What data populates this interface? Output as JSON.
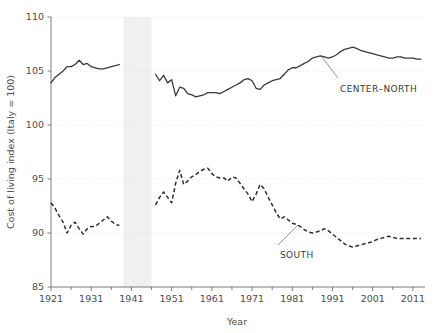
{
  "chart_data": {
    "type": "line",
    "title": "",
    "xlabel": "Year",
    "ylabel": "Cost of living index (Italy = 100)",
    "xlim": [
      1921,
      2014
    ],
    "ylim": [
      85,
      110
    ],
    "yticks": [
      85,
      90,
      95,
      100,
      105,
      110
    ],
    "xticks": [
      1921,
      1931,
      1941,
      1951,
      1961,
      1971,
      1981,
      1991,
      2001,
      2011
    ],
    "xminorticks": [
      1926,
      1936,
      1946,
      1956,
      1966,
      1976,
      1986,
      1996,
      2006
    ],
    "grid": "horizontal-dotted",
    "legend_position": "inline-annotation",
    "annotations": [
      {
        "text": "CENTER–NORTH",
        "series": "center_north",
        "x": 1995,
        "y": 104.3
      },
      {
        "text": "SOUTH",
        "series": "south",
        "x": 1988,
        "y": 87.6
      }
    ],
    "shaded_region": {
      "label": "war-gap",
      "x0": 1939,
      "x1": 1946,
      "color": "#f0f0f0"
    },
    "series": [
      {
        "name": "CENTER–NORTH",
        "style": "solid",
        "color": "#3a3a3a",
        "segments": [
          {
            "x": [
              1921,
              1922,
              1923,
              1924,
              1925,
              1926,
              1927,
              1928,
              1929,
              1930,
              1931,
              1932,
              1933,
              1934,
              1935,
              1936,
              1937,
              1938
            ],
            "values": [
              103.9,
              104.4,
              104.7,
              105.0,
              105.4,
              105.4,
              105.6,
              106.0,
              105.6,
              105.7,
              105.4,
              105.3,
              105.2,
              105.2,
              105.3,
              105.4,
              105.5,
              105.6
            ]
          },
          {
            "x": [
              1947,
              1948,
              1949,
              1950,
              1951,
              1952,
              1953,
              1954,
              1955,
              1956,
              1957,
              1958,
              1959,
              1960,
              1961,
              1962,
              1963,
              1964,
              1965,
              1966,
              1967,
              1968,
              1969,
              1970,
              1971,
              1972,
              1973,
              1974,
              1975,
              1976,
              1977,
              1978,
              1979,
              1980,
              1981,
              1982,
              1983,
              1984,
              1985,
              1986,
              1987,
              1988,
              1989,
              1990,
              1991,
              1992,
              1993,
              1994,
              1995,
              1996,
              1997,
              1998,
              1999,
              2000,
              2001,
              2002,
              2003,
              2004,
              2005,
              2006,
              2007,
              2008,
              2009,
              2010,
              2011,
              2012,
              2013
            ],
            "values": [
              104.7,
              104.1,
              104.6,
              103.9,
              104.2,
              102.7,
              103.5,
              103.4,
              102.9,
              102.8,
              102.6,
              102.7,
              102.8,
              103.0,
              103.0,
              103.0,
              102.9,
              103.1,
              103.3,
              103.5,
              103.7,
              103.9,
              104.2,
              104.3,
              104.1,
              103.4,
              103.3,
              103.7,
              103.9,
              104.1,
              104.2,
              104.3,
              104.7,
              105.1,
              105.3,
              105.3,
              105.5,
              105.7,
              105.9,
              106.2,
              106.3,
              106.4,
              106.3,
              106.2,
              106.3,
              106.5,
              106.8,
              107.0,
              107.1,
              107.2,
              107.1,
              106.9,
              106.8,
              106.7,
              106.6,
              106.5,
              106.4,
              106.3,
              106.2,
              106.2,
              106.3,
              106.3,
              106.2,
              106.2,
              106.2,
              106.1,
              106.1
            ]
          }
        ]
      },
      {
        "name": "SOUTH",
        "style": "dashed",
        "color": "#2e2e2e",
        "segments": [
          {
            "x": [
              1921,
              1922,
              1923,
              1924,
              1925,
              1926,
              1927,
              1928,
              1929,
              1930,
              1931,
              1932,
              1933,
              1934,
              1935,
              1936,
              1937,
              1938
            ],
            "values": [
              92.8,
              92.3,
              91.6,
              91.0,
              90.0,
              90.7,
              91.0,
              90.4,
              89.9,
              90.4,
              90.6,
              90.6,
              90.9,
              91.2,
              91.5,
              91.1,
              90.8,
              90.7
            ]
          },
          {
            "x": [
              1947,
              1948,
              1949,
              1950,
              1951,
              1952,
              1953,
              1954,
              1955,
              1956,
              1957,
              1958,
              1959,
              1960,
              1961,
              1962,
              1963,
              1964,
              1965,
              1966,
              1967,
              1968,
              1969,
              1970,
              1971,
              1972,
              1973,
              1974,
              1975,
              1976,
              1977,
              1978,
              1979,
              1980,
              1981,
              1982,
              1983,
              1984,
              1985,
              1986,
              1987,
              1988,
              1989,
              1990,
              1991,
              1992,
              1993,
              1994,
              1995,
              1996,
              1997,
              1998,
              1999,
              2000,
              2001,
              2002,
              2003,
              2004,
              2005,
              2006,
              2007,
              2008,
              2009,
              2010,
              2011,
              2012,
              2013
            ],
            "values": [
              92.6,
              93.3,
              93.8,
              93.3,
              92.8,
              94.6,
              95.8,
              94.5,
              94.8,
              95.2,
              95.4,
              95.7,
              95.9,
              96.0,
              95.5,
              95.2,
              95.1,
              95.1,
              94.8,
              95.2,
              95.1,
              94.6,
              94.1,
              93.6,
              92.9,
              93.6,
              94.5,
              94.1,
              93.3,
              92.6,
              91.9,
              91.3,
              91.5,
              91.2,
              90.9,
              90.8,
              90.6,
              90.3,
              90.1,
              90.0,
              90.1,
              90.2,
              90.4,
              90.2,
              89.9,
              89.6,
              89.3,
              89.0,
              88.8,
              88.7,
              88.8,
              88.9,
              89.0,
              89.1,
              89.2,
              89.4,
              89.5,
              89.6,
              89.7,
              89.6,
              89.5,
              89.5,
              89.5,
              89.5,
              89.5,
              89.5,
              89.5
            ]
          }
        ]
      }
    ]
  },
  "axes": {
    "x_title": "Year",
    "y_title": "Cost of living index (Italy = 100)",
    "x_tick_labels": [
      "1921",
      "1931",
      "1941",
      "1951",
      "1961",
      "1971",
      "1981",
      "1991",
      "2001",
      "2011"
    ],
    "y_tick_labels": [
      "85",
      "90",
      "95",
      "100",
      "105",
      "110"
    ]
  },
  "labels": {
    "center_north": "CENTER–NORTH",
    "south": "SOUTH"
  },
  "colors": {
    "series_center_north": "#3a3a3a",
    "series_south": "#2e2e2e",
    "gridline": "#e2e2e2",
    "axis": "#6f6f6f",
    "war_band": "#f0f0f0",
    "text": "#4d4d4d",
    "background": "#ffffff"
  }
}
